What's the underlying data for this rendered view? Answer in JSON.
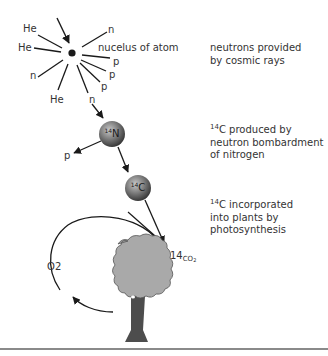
{
  "diagram": {
    "nucleus": {
      "label": "nucelus of atom",
      "particles": [
        {
          "label": "He",
          "position": "upper-left"
        },
        {
          "label": "He",
          "position": "left"
        },
        {
          "label": "n",
          "position": "lower-left"
        },
        {
          "label": "He",
          "position": "bottom"
        },
        {
          "label": "n",
          "position": "upper-right"
        },
        {
          "label": "p",
          "position": "right-1"
        },
        {
          "label": "p",
          "position": "right-2"
        },
        {
          "label": "p",
          "position": "right-3"
        },
        {
          "label": "n",
          "position": "lower-right"
        }
      ]
    },
    "nitrogen": {
      "mass": "14",
      "symbol": "N",
      "emitted": "p"
    },
    "carbon": {
      "mass": "14",
      "symbol": "C"
    },
    "co2": {
      "mass": "14",
      "formula": "CO",
      "subscript": "2"
    },
    "o2": {
      "label": "O",
      "subscript": "2"
    },
    "captions": [
      {
        "lines": [
          "neutrons provided",
          "by cosmic rays"
        ]
      },
      {
        "mass": "14",
        "lines": [
          "C produced by",
          "neutron bombardment",
          "of nitrogen"
        ]
      },
      {
        "mass": "14",
        "lines": [
          "C incorporated",
          "into plants by",
          "photosynthesis"
        ]
      }
    ],
    "colors": {
      "line": "#1a1a1a",
      "sphere": "#6b6b6b",
      "tree_crown": "#a9a9a9",
      "tree_trunk": "#4d4d4d",
      "rule": "#8a8a8a"
    }
  }
}
